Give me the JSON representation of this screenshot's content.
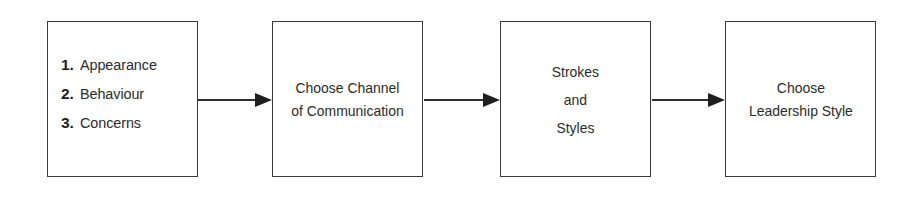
{
  "diagram": {
    "type": "flowchart",
    "orientation": "left-to-right",
    "background_color": "#ffffff",
    "stroke_color": "#3a3a3a",
    "text_color": "#2b2b2b",
    "nodes": [
      {
        "id": "node-1",
        "shape": "rectangle",
        "content_type": "numbered-list",
        "items": [
          {
            "number": "1.",
            "label": "Appearance"
          },
          {
            "number": "2.",
            "label": "Behaviour"
          },
          {
            "number": "3.",
            "label": "Concerns"
          }
        ]
      },
      {
        "id": "node-2",
        "shape": "rectangle",
        "content_type": "caption",
        "lines": [
          "Choose Channel",
          "of Communication"
        ]
      },
      {
        "id": "node-3",
        "shape": "rectangle",
        "content_type": "caption",
        "lines": [
          "Strokes",
          "and",
          "Styles"
        ]
      },
      {
        "id": "node-4",
        "shape": "rectangle",
        "content_type": "caption",
        "lines": [
          "Choose",
          "Leadership Style"
        ]
      }
    ],
    "connectors": [
      {
        "id": "connector-1",
        "from": "node-1",
        "to": "node-2",
        "style": "solid-arrow"
      },
      {
        "id": "connector-2",
        "from": "node-2",
        "to": "node-3",
        "style": "solid-arrow"
      },
      {
        "id": "connector-3",
        "from": "node-3",
        "to": "node-4",
        "style": "solid-arrow"
      }
    ]
  }
}
